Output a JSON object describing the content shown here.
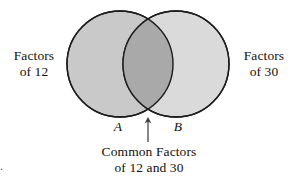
{
  "figure": {
    "type": "venn-diagram",
    "background_color": "#ffffff",
    "left_label": "Factors\nof 12",
    "left_label_line1": "Factors",
    "left_label_line2": "of 12",
    "right_label_line1": "Factors",
    "right_label_line2": "of 30",
    "set_a_label": "A",
    "set_b_label": "B",
    "caption_line1": "Common Factors",
    "caption_line2": "of 12 and 30",
    "corner_mark": ".",
    "colors": {
      "left_circle_fill": "#c9c9c9",
      "right_circle_fill": "#d9d9d9",
      "intersection_fill": "#a9a9a9",
      "circle_stroke": "#1c1c1c",
      "arrow_color": "#3a3a3a",
      "text_color": "#111111"
    },
    "geometry": {
      "left_circle_cx": 120,
      "left_circle_cy": 64,
      "left_circle_r": 53,
      "right_circle_cx": 176,
      "right_circle_cy": 64,
      "right_circle_r": 53,
      "arrow_x": 148,
      "arrow_top_y": 118,
      "arrow_bottom_y": 142
    }
  }
}
